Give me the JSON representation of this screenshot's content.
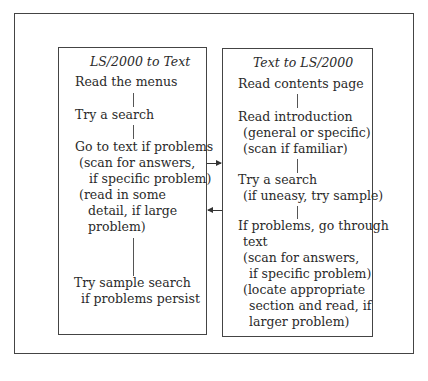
{
  "diagram": {
    "left_panel": {
      "title": "LS/2000 to Text",
      "steps": [
        {
          "lines": [
            "Read the menus"
          ]
        },
        {
          "lines": [
            "Try a search"
          ]
        },
        {
          "lines": [
            "Go to text if problems",
            "(scan for answers,",
            "if specific problem)",
            "(read in some",
            "detail, if large",
            "problem)"
          ]
        },
        {
          "lines": [
            "Try sample search",
            "if problems persist"
          ]
        }
      ]
    },
    "right_panel": {
      "title": "Text to LS/2000",
      "steps": [
        {
          "lines": [
            "Read contents page"
          ]
        },
        {
          "lines": [
            "Read introduction",
            "(general or specific)",
            "(scan if familiar)"
          ]
        },
        {
          "lines": [
            "Try a search",
            "(if uneasy, try sample)"
          ]
        },
        {
          "lines": [
            "If problems, go through",
            "text",
            "(scan for answers,",
            "if specific problem)",
            "(locate appropriate",
            "section and read, if",
            "larger problem)"
          ]
        }
      ]
    },
    "arrows": [
      {
        "from": "left_panel",
        "to": "right_panel",
        "direction": "right"
      },
      {
        "from": "right_panel",
        "to": "left_panel",
        "direction": "left"
      }
    ]
  }
}
